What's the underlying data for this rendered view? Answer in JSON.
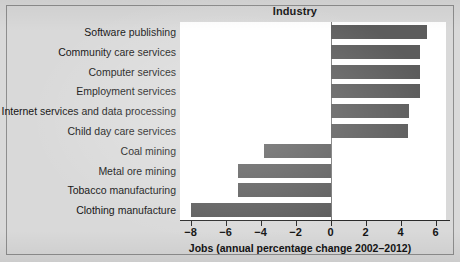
{
  "figure": {
    "background_color": "#d9d9d9",
    "plot_background_color": "#ffffff",
    "border_color": "#8e8e8e"
  },
  "chart_data": {
    "type": "bar",
    "orientation": "horizontal",
    "title": "Industry",
    "xlabel": "Jobs (annual percentage change 2002–2012)",
    "ylabel": "Industry",
    "bar_color": "#5c5c5c",
    "grid": false,
    "legend": null,
    "xlim": [
      -8.6,
      6.6
    ],
    "xticks": [
      -8,
      -6,
      -4,
      -2,
      0,
      2,
      4,
      6
    ],
    "xticklabels": [
      "−8",
      "−6",
      "−4",
      "−2",
      "0",
      "2",
      "4",
      "6"
    ],
    "categories": [
      "Software publishing",
      "Community care services",
      "Computer services",
      "Employment services",
      "Internet services and data processing",
      "Child day care services",
      "Coal mining",
      "Metal ore mining",
      "Tobacco manufacturing",
      "Clothing manufacture"
    ],
    "values": [
      5.5,
      5.1,
      5.1,
      5.1,
      4.5,
      4.4,
      -3.8,
      -5.3,
      -5.3,
      -8.0
    ]
  }
}
